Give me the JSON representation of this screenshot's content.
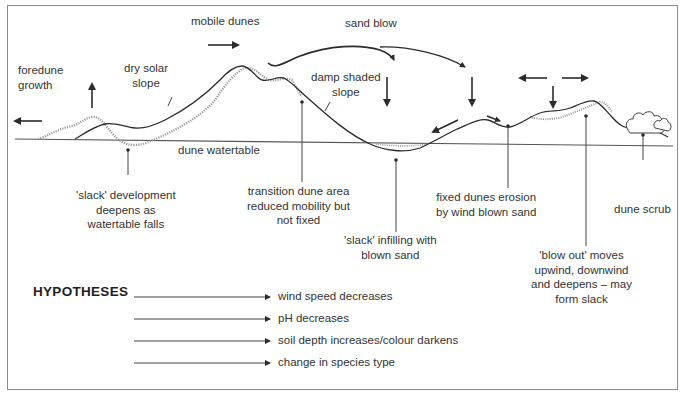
{
  "diagram": {
    "labels": {
      "foredune_growth": [
        "foredune",
        "growth"
      ],
      "dry_solar_slope": [
        "dry solar",
        "slope"
      ],
      "mobile_dunes": "mobile dunes",
      "sand_blow": "sand blow",
      "damp_shaded_slope": [
        "damp shaded",
        "slope"
      ],
      "dune_watertable": "dune watertable",
      "slack_development": [
        "'slack' development",
        "deepens as",
        "watertable falls"
      ],
      "transition_dune": [
        "transition dune area",
        "reduced mobility but",
        "not fixed"
      ],
      "slack_infilling": [
        "'slack' infilling with",
        "blown sand"
      ],
      "fixed_dunes_erosion": [
        "fixed dunes erosion",
        "by wind blown sand"
      ],
      "blow_out": [
        "'blow out' moves",
        "upwind, downwind",
        "and deepens – may",
        "form slack"
      ],
      "dune_scrub": "dune scrub"
    },
    "colors": {
      "line": "#2b2b2b",
      "stipple": "#9a9a9a",
      "frame": "#8a8a8a",
      "text": "#333333"
    }
  },
  "hypotheses": {
    "title": "HYPOTHESES",
    "items": [
      "wind speed decreases",
      "pH decreases",
      "soil depth increases/colour darkens",
      "change in species type"
    ]
  }
}
